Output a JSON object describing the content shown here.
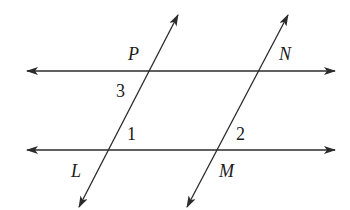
{
  "diagram": {
    "colors": {
      "stroke": "#2b2b2b",
      "text": "#1a1a1a",
      "background": "#ffffff"
    },
    "lines": {
      "top_horizontal": {
        "x1": 27,
        "y1": 71,
        "x2": 335,
        "y2": 71,
        "arrows": "both"
      },
      "bottom_horizontal": {
        "x1": 27,
        "y1": 150,
        "x2": 335,
        "y2": 150,
        "arrows": "both"
      },
      "left_transversal": {
        "x1": 178,
        "y1": 15,
        "x2": 79,
        "y2": 207,
        "arrows": "both"
      },
      "right_transversal": {
        "x1": 288,
        "y1": 15,
        "x2": 187,
        "y2": 207,
        "arrows": "both"
      }
    },
    "points": {
      "P": {
        "label": "P"
      },
      "N": {
        "label": "N"
      },
      "L": {
        "label": "L"
      },
      "M": {
        "label": "M"
      }
    },
    "angles": {
      "a1": {
        "label": "1"
      },
      "a2": {
        "label": "2"
      },
      "a3": {
        "label": "3"
      }
    }
  }
}
